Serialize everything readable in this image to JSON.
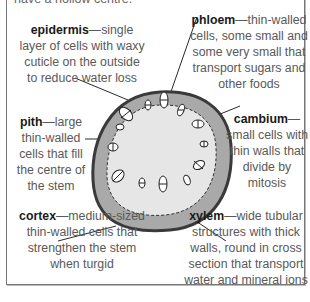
{
  "header": {
    "clipped_text": "have a hollow centre."
  },
  "labels": {
    "epidermis": {
      "term": "epidermis",
      "desc_lines": [
        "—single",
        "layer of cells with waxy",
        "cuticle on the outside",
        "to reduce water loss"
      ]
    },
    "phloem": {
      "term": "phloem",
      "desc_lines": [
        "—thin-walled",
        "cells, some small and",
        "some very small that",
        "transport sugars and",
        "other foods"
      ]
    },
    "pith": {
      "term": "pith",
      "desc_lines": [
        "—large",
        "thin-walled",
        "cells that fill",
        "the centre of",
        "the stem"
      ]
    },
    "cambium": {
      "term": "cambium",
      "desc_lines": [
        "—",
        "small cells with",
        "thin walls that",
        "divide by",
        "mitosis"
      ]
    },
    "cortex": {
      "term": "cortex",
      "desc_lines": [
        "—medium-sized",
        "thin-walled cells that",
        "strengthen the stem",
        "when turgid"
      ]
    },
    "xylem": {
      "term": "xylem",
      "desc_lines": [
        "—wide tubular",
        "structures with thick",
        "walls, round in cross",
        "section that transport",
        "water and mineral ions"
      ]
    }
  },
  "colors": {
    "epidermis_outline": "#3a3a3a",
    "cortex_fill": "#a9a9a9",
    "pith_fill": "#e6e6e6",
    "text_term": "#1a1a1a",
    "text_desc": "#595959",
    "frame": "#777777"
  }
}
